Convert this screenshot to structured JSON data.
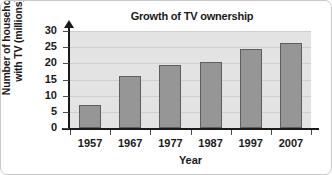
{
  "chart_data": {
    "type": "bar",
    "title": "Growth of TV ownership",
    "xlabel": "Year",
    "ylabel": "Number of households\nwith TV (millions)",
    "categories": [
      "1957",
      "1967",
      "1977",
      "1987",
      "1997",
      "2007"
    ],
    "values": [
      7,
      16,
      19.5,
      20.5,
      24.5,
      26.2
    ],
    "series": [
      {
        "name": "Households with TV",
        "values": [
          7,
          16,
          19.5,
          20.5,
          24.5,
          26.2
        ]
      }
    ],
    "ylim": [
      0,
      30
    ],
    "yticks": [
      "0",
      "5",
      "10",
      "15",
      "20",
      "25",
      "30"
    ],
    "ytick_values": [
      0,
      5,
      10,
      15,
      20,
      25,
      30
    ],
    "grid": true,
    "legend": false,
    "legend_position": "none",
    "colors": {
      "bar_fill": "#969696",
      "bar_edge": "#5e5e5e",
      "plot_background": "#e3e3e3",
      "gridline": "#cfcfcf",
      "axis": "#1a1a1a",
      "figure_background": "#ffffff"
    }
  }
}
